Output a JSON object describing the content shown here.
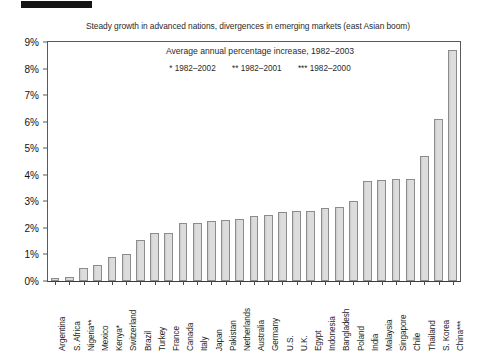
{
  "top_mark": {
    "name": "black-marker-bar"
  },
  "chart_data": {
    "type": "bar",
    "title": "Steady growth in advanced nations, divergences in emerging markets (east Asian boom)",
    "subtitle": "Average annual percentage increase, 1982–2003",
    "footnotes": [
      "* 1982–2002",
      "** 1982–2001",
      "*** 1982–2000"
    ],
    "xlabel": "",
    "ylabel": "",
    "ylim": [
      0,
      9
    ],
    "ytick_labels": [
      "0%",
      "1%",
      "2%",
      "3%",
      "4%",
      "5%",
      "6%",
      "7%",
      "8%",
      "9%"
    ],
    "ytick_values": [
      0,
      1,
      2,
      3,
      4,
      5,
      6,
      7,
      8,
      9
    ],
    "grid": false,
    "legend_position": "none",
    "bar_color": "#d9d9d9",
    "bar_edge_color": "#8c8c8c",
    "categories": [
      "Argentina",
      "S. Africa",
      "Nigeria**",
      "Mexico",
      "Kenya*",
      "Switzerland",
      "Brazil",
      "Turkey",
      "France",
      "Canada",
      "Italy",
      "Japan",
      "Pakistan",
      "Netherlands",
      "Australia",
      "Germany",
      "U.S.",
      "U.K.",
      "Egypt",
      "Indonesia",
      "Bangladesh",
      "Poland",
      "India",
      "Malaysia",
      "Singapore",
      "Chile",
      "Thailand",
      "S. Korea",
      "China***"
    ],
    "values": [
      0.1,
      0.15,
      0.5,
      0.6,
      0.9,
      1.0,
      1.55,
      1.8,
      1.8,
      2.2,
      2.2,
      2.25,
      2.3,
      2.35,
      2.45,
      2.5,
      2.6,
      2.65,
      2.65,
      2.75,
      2.8,
      3.0,
      3.75,
      3.8,
      3.85,
      3.85,
      4.7,
      6.1,
      8.7
    ]
  }
}
